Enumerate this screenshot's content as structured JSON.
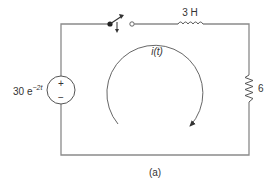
{
  "figure": {
    "caption": "(a)",
    "type": "circuit-schematic"
  },
  "components": {
    "source": {
      "label_base": "30 e",
      "label_exp": "−2t",
      "plus": "+",
      "minus": "−"
    },
    "inductor": {
      "label": "3 H"
    },
    "resistor": {
      "label": "6"
    },
    "switch": {
      "state": "open"
    }
  },
  "loop_current": {
    "label": "i(t)",
    "direction": "clockwise"
  },
  "colors": {
    "wire": "#8a8a8a",
    "text": "#333333",
    "background": "#ffffff"
  }
}
